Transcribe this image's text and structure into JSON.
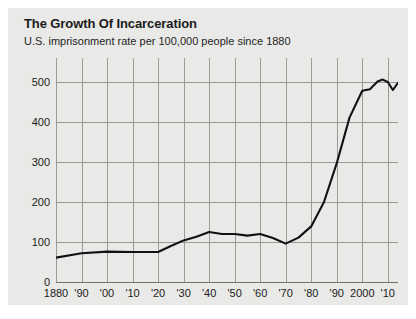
{
  "card": {
    "title": "The Growth Of Incarceration",
    "subtitle": "U.S. imprisonment rate per 100,000 people since 1880",
    "background": "#e9e9e7",
    "page_background": "#ffffff"
  },
  "chart_data": {
    "type": "line",
    "title": "The Growth Of Incarceration",
    "subtitle": "U.S. imprisonment rate per 100,000 people since 1880",
    "xlabel": "",
    "ylabel": "",
    "xlim": [
      1880,
      2014
    ],
    "ylim": [
      0,
      560
    ],
    "grid": true,
    "legend": null,
    "line_color": "#111111",
    "grid_color": "#9a9a96",
    "y_ticks": [
      0,
      100,
      200,
      300,
      400,
      500
    ],
    "y_tick_labels": [
      "0",
      "100",
      "200",
      "300",
      "400",
      "500"
    ],
    "x_ticks": [
      1880,
      1890,
      1900,
      1910,
      1920,
      1930,
      1940,
      1950,
      1960,
      1970,
      1980,
      1990,
      2000,
      2010
    ],
    "x_tick_labels": [
      "1880",
      "'90",
      "'00",
      "'10",
      "'20",
      "'30",
      "'40",
      "'50",
      "'60",
      "'70",
      "'80",
      "'90",
      "2000",
      "'10"
    ],
    "x": [
      1880,
      1890,
      1900,
      1910,
      1920,
      1925,
      1930,
      1935,
      1940,
      1945,
      1950,
      1955,
      1960,
      1965,
      1970,
      1975,
      1980,
      1985,
      1990,
      1995,
      2000,
      2003,
      2006,
      2008,
      2010,
      2012,
      2014
    ],
    "values": [
      61,
      72,
      76,
      75,
      75,
      90,
      104,
      113,
      125,
      120,
      120,
      116,
      120,
      110,
      96,
      111,
      139,
      200,
      297,
      411,
      478,
      482,
      501,
      506,
      500,
      480,
      498
    ],
    "series": [
      {
        "name": "U.S. imprisonment rate per 100,000 people",
        "values": [
          61,
          72,
          76,
          75,
          75,
          90,
          104,
          113,
          125,
          120,
          120,
          116,
          120,
          110,
          96,
          111,
          139,
          200,
          297,
          411,
          478,
          482,
          501,
          506,
          500,
          480,
          498
        ]
      }
    ]
  }
}
